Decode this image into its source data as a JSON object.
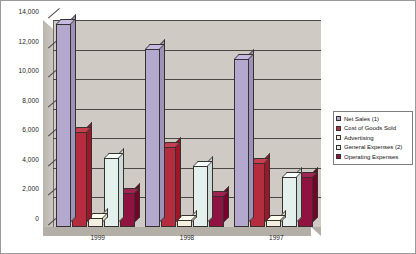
{
  "chart_data": {
    "type": "bar",
    "title": "",
    "xlabel": "",
    "ylabel": "",
    "categories": [
      "1999",
      "1998",
      "1997"
    ],
    "ylim": [
      0,
      14000
    ],
    "ytick_labels": [
      "14,000",
      "12,000",
      "10,000",
      "8,000",
      "6,000",
      "4,000",
      "2,000",
      "0"
    ],
    "ytick_values": [
      14000,
      12000,
      10000,
      8000,
      6000,
      4000,
      2000,
      0
    ],
    "grid": true,
    "legend_position": "right",
    "style": "3d-clustered-column",
    "series": [
      {
        "name": "Net Sales (1)",
        "color": "#b3a8cd",
        "values": [
          13700,
          12050,
          11350
        ]
      },
      {
        "name": "Cost of Goods Sold",
        "color": "#b52c3e",
        "values": [
          6400,
          5400,
          4300
        ]
      },
      {
        "name": "Advertising",
        "color": "#f3eedd",
        "values": [
          600,
          500,
          450
        ]
      },
      {
        "name": "General Expenses (2)",
        "color": "#e4f0ec",
        "values": [
          4700,
          4100,
          3400
        ]
      },
      {
        "name": "Operating Expenses",
        "color": "#8f1240",
        "values": [
          2300,
          2100,
          3400
        ]
      }
    ]
  },
  "colors": {
    "plot_background": "#cfcbc4",
    "gridline": "#4a4844",
    "frame_border": "#9a9a9a",
    "legend_border": "#7d7d7d",
    "bar_outline": "#35312e"
  },
  "legend": {
    "items": [
      {
        "label": "Net Sales (1)"
      },
      {
        "label": "Cost of Goods Sold"
      },
      {
        "label": "Advertising"
      },
      {
        "label": "General Expenses (2)"
      },
      {
        "label": "Operating Expenses"
      }
    ]
  }
}
